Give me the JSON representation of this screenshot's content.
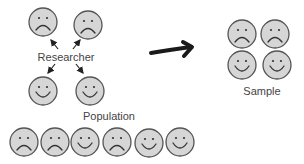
{
  "labels": {
    "researcher": "Researcher",
    "population": "Population",
    "sample": "Sample"
  },
  "colors": {
    "face_fill": "#d6d6d6",
    "face_stroke": "#555555",
    "text": "#444444",
    "arrow": "#222222"
  },
  "researcher_group": [
    {
      "x": 43,
      "y": 22,
      "mood": "sad"
    },
    {
      "x": 88,
      "y": 25,
      "mood": "sad"
    },
    {
      "x": 43,
      "y": 91,
      "mood": "happy"
    },
    {
      "x": 90,
      "y": 91,
      "mood": "happy"
    }
  ],
  "population_row": [
    {
      "x": 24,
      "y": 142,
      "mood": "sad"
    },
    {
      "x": 55,
      "y": 142,
      "mood": "sad"
    },
    {
      "x": 85,
      "y": 142,
      "mood": "happy"
    },
    {
      "x": 117,
      "y": 142,
      "mood": "sad"
    },
    {
      "x": 149,
      "y": 143,
      "mood": "happy"
    },
    {
      "x": 180,
      "y": 142,
      "mood": "happy"
    }
  ],
  "sample_group": [
    {
      "x": 242,
      "y": 34,
      "mood": "sad"
    },
    {
      "x": 275,
      "y": 34,
      "mood": "sad"
    },
    {
      "x": 242,
      "y": 65,
      "mood": "happy"
    },
    {
      "x": 277,
      "y": 65,
      "mood": "happy"
    }
  ],
  "icons": {
    "face_happy": "smiley-face-icon",
    "face_sad": "frowning-face-icon",
    "big_arrow": "right-arrow-icon"
  }
}
